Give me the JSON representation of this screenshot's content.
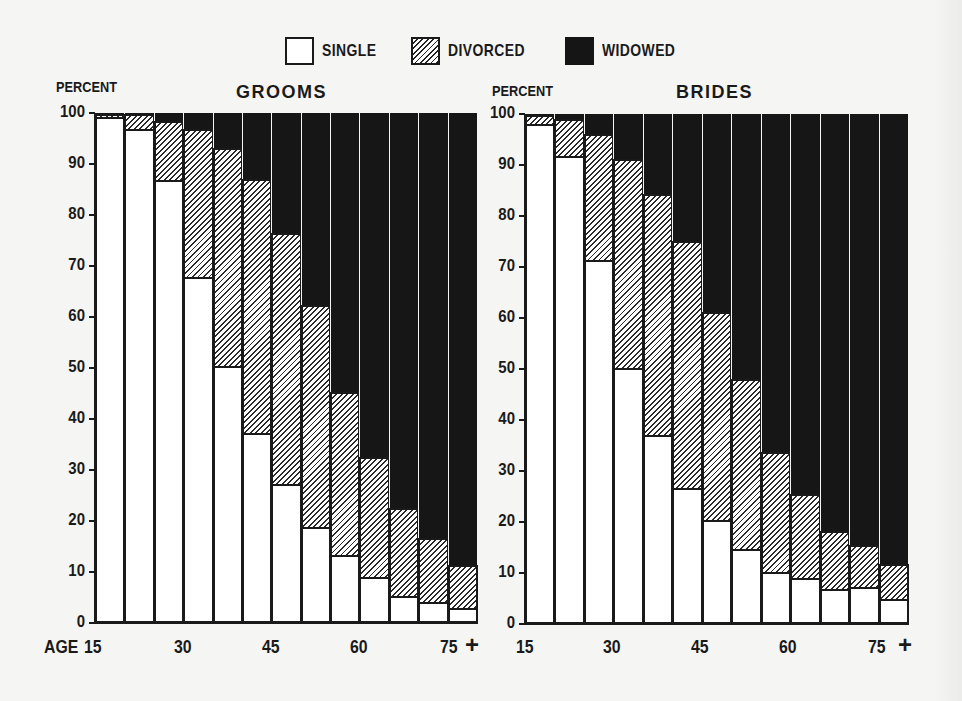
{
  "legend": {
    "items": [
      {
        "key": "single",
        "label": "SINGLE"
      },
      {
        "key": "divorced",
        "label": "DIVORCED"
      },
      {
        "key": "widowed",
        "label": "WIDOWED"
      }
    ]
  },
  "panels": {
    "grooms": {
      "title": "GROOMS",
      "ylabel": "PERCENT",
      "x_prefix": "AGE",
      "x_ticks": [
        "15",
        "30",
        "45",
        "60",
        "75"
      ],
      "x_plus": "+"
    },
    "brides": {
      "title": "BRIDES",
      "ylabel": "PERCENT",
      "x_ticks": [
        "15",
        "30",
        "45",
        "60",
        "75"
      ],
      "x_plus": "+"
    }
  },
  "y_ticks": [
    "0",
    "10",
    "20",
    "30",
    "40",
    "50",
    "60",
    "70",
    "80",
    "90",
    "100"
  ],
  "chart_data": [
    {
      "type": "bar",
      "stacked": true,
      "title": "GROOMS",
      "xlabel": "AGE",
      "ylabel": "PERCENT",
      "ylim": [
        0,
        100
      ],
      "grid": false,
      "legend_position": "top-center",
      "categories": [
        "15-19",
        "20-24",
        "25-29",
        "30-34",
        "35-39",
        "40-44",
        "45-49",
        "50-54",
        "55-59",
        "60-64",
        "65-69",
        "70-74",
        "75+"
      ],
      "x_tick_labels": [
        "AGE 15",
        "30",
        "45",
        "60",
        "75 +"
      ],
      "series": [
        {
          "name": "SINGLE",
          "values": [
            99.2,
            96.9,
            86.9,
            67.8,
            50.4,
            37.3,
            27.3,
            18.8,
            13.3,
            9.0,
            5.3,
            4.1,
            3.0
          ]
        },
        {
          "name": "DIVORCED",
          "values": [
            0.7,
            2.9,
            11.5,
            29.0,
            42.7,
            49.7,
            49.2,
            43.6,
            32.0,
            23.5,
            17.2,
            12.6,
            8.4
          ]
        },
        {
          "name": "WIDOWED",
          "values": [
            0.1,
            0.2,
            1.6,
            3.2,
            6.9,
            13.0,
            23.5,
            37.6,
            54.7,
            67.5,
            77.5,
            83.3,
            88.6
          ]
        }
      ]
    },
    {
      "type": "bar",
      "stacked": true,
      "title": "BRIDES",
      "xlabel": "AGE",
      "ylabel": "PERCENT",
      "ylim": [
        0,
        100
      ],
      "grid": false,
      "legend_position": "top-center",
      "categories": [
        "15-19",
        "20-24",
        "25-29",
        "30-34",
        "35-39",
        "40-44",
        "45-49",
        "50-54",
        "55-59",
        "60-64",
        "65-69",
        "70-74",
        "75+"
      ],
      "x_tick_labels": [
        "15",
        "30",
        "45",
        "60",
        "75 +"
      ],
      "series": [
        {
          "name": "SINGLE",
          "values": [
            98.0,
            91.8,
            71.4,
            50.2,
            37.0,
            26.6,
            20.3,
            14.7,
            10.2,
            9.1,
            6.8,
            7.3,
            4.9
          ]
        },
        {
          "name": "DIVORCED",
          "values": [
            1.8,
            7.2,
            24.7,
            41.0,
            47.3,
            48.5,
            40.9,
            33.3,
            23.6,
            16.3,
            11.4,
            8.2,
            6.9
          ]
        },
        {
          "name": "WIDOWED",
          "values": [
            0.2,
            1.0,
            3.9,
            8.8,
            15.7,
            24.9,
            38.8,
            52.0,
            66.2,
            74.6,
            81.8,
            84.5,
            88.2
          ]
        }
      ]
    }
  ]
}
